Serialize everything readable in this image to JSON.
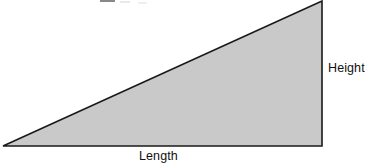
{
  "figure": {
    "background_color": "#FFFFFF",
    "width": 369,
    "height": 165
  },
  "shape": {
    "name": "right-triangle",
    "fill_color": "#C9C9C9",
    "stroke_color": "#1A1A1A",
    "stroke_width": 1.6,
    "vertices": [
      {
        "name": "bottom-left",
        "x": 3,
        "y": 146
      },
      {
        "name": "bottom-right",
        "x": 322,
        "y": 146
      },
      {
        "name": "apex-top-right",
        "x": 322,
        "y": 1
      }
    ]
  },
  "labels": {
    "height": "Height",
    "length": "Length"
  },
  "artifact": {
    "description": "cut-off-text-descender"
  },
  "chart_data": {
    "type": "diagram",
    "title": "",
    "shapes": [
      {
        "type": "right-triangle",
        "fill": "#C9C9C9",
        "stroke": "#1A1A1A",
        "points": [
          [
            3,
            146
          ],
          [
            322,
            146
          ],
          [
            322,
            1
          ]
        ],
        "annotations": [
          {
            "text": "Length",
            "side": "bottom",
            "x": 159,
            "y": 156
          },
          {
            "text": "Height",
            "side": "right",
            "x": 346,
            "y": 68
          }
        ]
      }
    ],
    "xlabel": "Length",
    "ylabel": "Height",
    "legend": []
  }
}
